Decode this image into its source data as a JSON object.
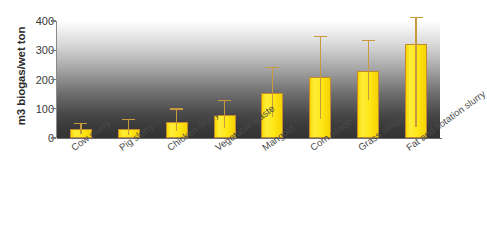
{
  "chart_data": {
    "type": "bar",
    "title": "",
    "subtitle": "",
    "xlabel": "",
    "ylabel": "m3 biogas/wet ton",
    "ylim": [
      0,
      400
    ],
    "yticks": [
      0,
      100,
      200,
      300,
      400
    ],
    "ytick_labels": [
      "0",
      "100",
      "200",
      "300",
      "400"
    ],
    "grid": false,
    "legend": null,
    "categories": [
      "Cow slurry",
      "Pig slurry",
      "Chicken slurry",
      "Vegetable waste",
      "Mangold",
      "Corn silage",
      "Grass silage",
      "Fat and flotation slurry"
    ],
    "values": [
      30,
      30,
      55,
      80,
      155,
      208,
      228,
      320
    ],
    "error_upper": [
      48,
      62,
      97,
      125,
      240,
      345,
      330,
      410
    ],
    "error_lower": [
      15,
      12,
      25,
      35,
      72,
      65,
      130,
      38
    ],
    "series": [
      {
        "name": "m3 biogas/wet ton",
        "values": [
          30,
          30,
          55,
          80,
          155,
          208,
          228,
          320
        ]
      }
    ],
    "bar_color": "#FFE81A",
    "bar_border_color": "#C4892C",
    "error_bar_color": "#C99A3D",
    "background": "gradient white to dark grey",
    "annotations": []
  },
  "axis": {
    "y_title": "m3 biogas/wet ton"
  }
}
